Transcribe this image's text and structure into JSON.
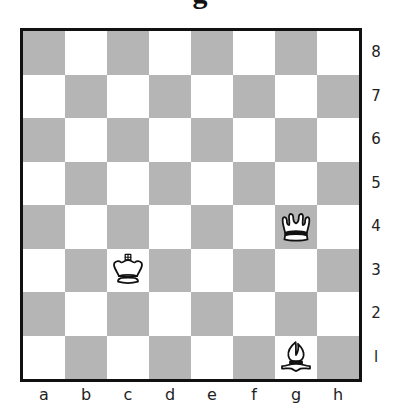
{
  "title": "g",
  "colors": {
    "light_square": "#ffffff",
    "dark_square": "#b5b5b5",
    "border": "#111111"
  },
  "files": [
    "a",
    "b",
    "c",
    "d",
    "e",
    "f",
    "g",
    "h"
  ],
  "ranks": [
    "8",
    "7",
    "6",
    "5",
    "4",
    "3",
    "2",
    "l"
  ],
  "pieces": [
    {
      "square": "g4",
      "color": "white",
      "type": "queen",
      "icon": "white-queen-icon"
    },
    {
      "square": "c3",
      "color": "white",
      "type": "king",
      "icon": "white-king-icon"
    },
    {
      "square": "g1",
      "color": "white",
      "type": "bishop",
      "icon": "white-bishop-icon"
    }
  ]
}
